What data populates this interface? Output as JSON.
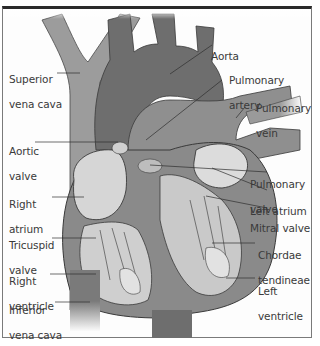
{
  "diagram": {
    "colors": {
      "vessel_light": "#9a9a9a",
      "vessel_dark": "#6e6e6e",
      "heart_wall": "#8a8a8a",
      "chamber_light": "#d8d8d8",
      "outline": "#3a3a3a",
      "frame_top": "#2a2a2a",
      "label_text": "#3a3a3a"
    },
    "labels": {
      "superior_vena_cava": {
        "line1": "Superior",
        "line2": "vena cava"
      },
      "aorta": {
        "line1": "Aorta"
      },
      "pulmonary_artery": {
        "line1": "Pulmonary",
        "line2": "artery"
      },
      "pulmonary_vein": {
        "line1": "Pulmonary",
        "line2": "vein"
      },
      "aortic_valve": {
        "line1": "Aortic",
        "line2": "valve"
      },
      "pulmonary_valve": {
        "line1": "Pulmonary",
        "line2": "valve"
      },
      "left_atrium": {
        "line1": "Left atrium"
      },
      "right_atrium": {
        "line1": "Right",
        "line2": "atrium"
      },
      "mitral_valve": {
        "line1": "Mitral valve"
      },
      "tricuspid_valve": {
        "line1": "Tricuspid",
        "line2": "valve"
      },
      "chordae_tendineae": {
        "line1": "Chordae",
        "line2": "tendineae"
      },
      "right_ventricle": {
        "line1": "Right",
        "line2": "ventricle"
      },
      "left_ventricle": {
        "line1": "Left",
        "line2": "ventricle"
      },
      "inferior_vena_cava": {
        "line1": "Inferior",
        "line2": "vena cava"
      }
    }
  }
}
